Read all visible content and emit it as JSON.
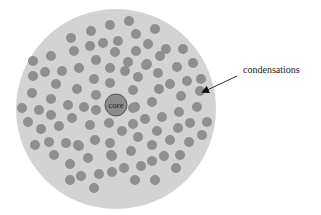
{
  "diagram": {
    "type": "schematic",
    "outer_circle": {
      "cx": 116,
      "cy": 109,
      "r": 100,
      "fill": "#d3d3d3"
    },
    "core": {
      "label": "core",
      "cx": 116,
      "cy": 105,
      "r": 11,
      "fill": "#8c8c8c",
      "stroke": "#555555"
    },
    "dot_color": "#8f8f8f",
    "dot_radius": 5,
    "annotation": {
      "label": "condensations",
      "arrow_from": [
        237,
        76
      ],
      "arrow_to": [
        203,
        92
      ]
    },
    "dots": [
      [
        110,
        25
      ],
      [
        129,
        21
      ],
      [
        155,
        29
      ],
      [
        91,
        31
      ],
      [
        136,
        34
      ],
      [
        71,
        38
      ],
      [
        103,
        43
      ],
      [
        118,
        41
      ],
      [
        90,
        46
      ],
      [
        148,
        44
      ],
      [
        166,
        49
      ],
      [
        183,
        49
      ],
      [
        74,
        51
      ],
      [
        115,
        52
      ],
      [
        136,
        51
      ],
      [
        160,
        56
      ],
      [
        33,
        61
      ],
      [
        51,
        56
      ],
      [
        96,
        60
      ],
      [
        128,
        62
      ],
      [
        146,
        65
      ],
      [
        147,
        64
      ],
      [
        193,
        63
      ],
      [
        33,
        76
      ],
      [
        45,
        72
      ],
      [
        62,
        71
      ],
      [
        79,
        68
      ],
      [
        110,
        68
      ],
      [
        125,
        71
      ],
      [
        138,
        77
      ],
      [
        158,
        73
      ],
      [
        177,
        67
      ],
      [
        201,
        79
      ],
      [
        56,
        84
      ],
      [
        32,
        93
      ],
      [
        77,
        89
      ],
      [
        94,
        79
      ],
      [
        110,
        83
      ],
      [
        133,
        90
      ],
      [
        159,
        89
      ],
      [
        170,
        84
      ],
      [
        187,
        81
      ],
      [
        200,
        91
      ],
      [
        22,
        108
      ],
      [
        39,
        110
      ],
      [
        51,
        99
      ],
      [
        68,
        105
      ],
      [
        84,
        107
      ],
      [
        96,
        95
      ],
      [
        133,
        108
      ],
      [
        152,
        102
      ],
      [
        181,
        96
      ],
      [
        197,
        107
      ],
      [
        28,
        122
      ],
      [
        51,
        115
      ],
      [
        72,
        118
      ],
      [
        96,
        110
      ],
      [
        135,
        107
      ],
      [
        145,
        119
      ],
      [
        162,
        117
      ],
      [
        179,
        112
      ],
      [
        190,
        123
      ],
      [
        207,
        122
      ],
      [
        41,
        129
      ],
      [
        59,
        126
      ],
      [
        90,
        125
      ],
      [
        109,
        123
      ],
      [
        133,
        124
      ],
      [
        157,
        131
      ],
      [
        178,
        128
      ],
      [
        202,
        135
      ],
      [
        35,
        145
      ],
      [
        49,
        142
      ],
      [
        66,
        143
      ],
      [
        78,
        145
      ],
      [
        95,
        140
      ],
      [
        110,
        143
      ],
      [
        122,
        131
      ],
      [
        138,
        137
      ],
      [
        152,
        145
      ],
      [
        170,
        140
      ],
      [
        189,
        142
      ],
      [
        54,
        155
      ],
      [
        79,
        146
      ],
      [
        112,
        156
      ],
      [
        131,
        151
      ],
      [
        164,
        156
      ],
      [
        180,
        155
      ],
      [
        70,
        164
      ],
      [
        88,
        158
      ],
      [
        111,
        155
      ],
      [
        124,
        168
      ],
      [
        141,
        166
      ],
      [
        152,
        161
      ],
      [
        176,
        168
      ],
      [
        70,
        180
      ],
      [
        81,
        176
      ],
      [
        99,
        174
      ],
      [
        112,
        172
      ],
      [
        135,
        180
      ],
      [
        155,
        180
      ],
      [
        94,
        188
      ]
    ]
  }
}
